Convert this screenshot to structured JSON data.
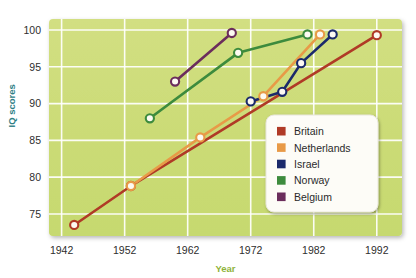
{
  "chart_data": {
    "type": "line",
    "title": "",
    "subtitle": "",
    "xlabel": "Year",
    "ylabel": "IQ scores",
    "xlim": [
      1940,
      1996
    ],
    "ylim": [
      72,
      101.5
    ],
    "xticks": [
      1942,
      1952,
      1962,
      1972,
      1982,
      1992
    ],
    "xtick_labels": [
      "1942",
      "1952",
      "1962",
      "1972",
      "1982",
      "1992"
    ],
    "yticks": [
      75,
      80,
      85,
      90,
      95,
      100
    ],
    "ytick_labels": [
      "75",
      "80",
      "85",
      "90",
      "95",
      "100"
    ],
    "grid": true,
    "grid_color": "#ffffff",
    "plot_background": "#cddc7a",
    "legend_position": "lower right",
    "marker": "circle-open-white",
    "series": [
      {
        "name": "Britain",
        "color": "#b03a26",
        "x": [
          1944,
          1953,
          1992
        ],
        "y": [
          73.5,
          78.8,
          99.3
        ]
      },
      {
        "name": "Netherlands",
        "color": "#e89a47",
        "x": [
          1953,
          1964,
          1974,
          1983
        ],
        "y": [
          78.8,
          85.4,
          91.0,
          99.4
        ]
      },
      {
        "name": "Israel",
        "color": "#1b2a6b",
        "x": [
          1972,
          1977,
          1980,
          1985
        ],
        "y": [
          90.3,
          91.6,
          95.5,
          99.4
        ]
      },
      {
        "name": "Norway",
        "color": "#3d8b3d",
        "x": [
          1956,
          1970,
          1981
        ],
        "y": [
          88.0,
          96.9,
          99.4
        ]
      },
      {
        "name": "Belgium",
        "color": "#6b2d5c",
        "x": [
          1960,
          1969
        ],
        "y": [
          93.0,
          99.6
        ]
      }
    ]
  },
  "legend": {
    "items": [
      {
        "label": "Britain",
        "color": "#b03a26"
      },
      {
        "label": "Netherlands",
        "color": "#e89a47"
      },
      {
        "label": "Israel",
        "color": "#1b2a6b"
      },
      {
        "label": "Norway",
        "color": "#3d8b3d"
      },
      {
        "label": "Belgium",
        "color": "#6b2d5c"
      }
    ]
  },
  "axes": {
    "x_title": "Year",
    "y_title": "IQ scores"
  }
}
